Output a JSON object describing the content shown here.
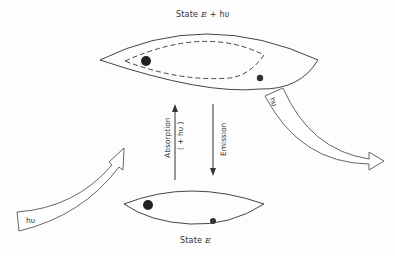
{
  "diagram": {
    "top_state": {
      "label_prefix": "State",
      "energy": "E",
      "suffix": "+ hυ"
    },
    "bottom_state": {
      "label_prefix": "State",
      "energy": "E"
    },
    "absorption": {
      "label": "Absorption",
      "sub": "( + hυ )"
    },
    "emission": {
      "label": "Emission"
    },
    "incoming_photon": {
      "label": "hυ"
    },
    "outgoing_photon": {
      "label": "hυ"
    }
  }
}
